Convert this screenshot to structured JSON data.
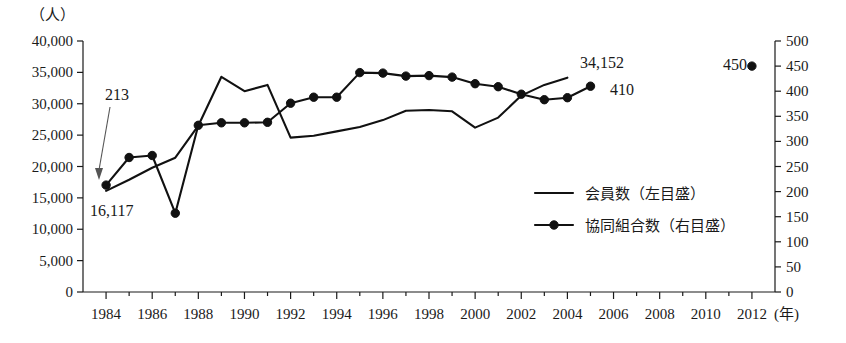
{
  "axes": {
    "left_unit": "（人）",
    "left_ticks": [
      "40,000",
      "35,000",
      "30,000",
      "25,000",
      "20,000",
      "15,000",
      "10,000",
      "5,000",
      "0"
    ],
    "left_min": 0,
    "left_max": 40000,
    "left_step": 5000,
    "right_ticks": [
      "500",
      "450",
      "400",
      "350",
      "300",
      "250",
      "200",
      "150",
      "100",
      "50",
      "0"
    ],
    "right_min": 0,
    "right_max": 500,
    "right_step": 50,
    "x_unit": "(年)",
    "x_ticks": [
      "1984",
      "1986",
      "1988",
      "1990",
      "1992",
      "1994",
      "1996",
      "1998",
      "2000",
      "2002",
      "2004",
      "2006",
      "2008",
      "2010",
      "2012"
    ],
    "x_min": 1983,
    "x_max": 2013
  },
  "legend": {
    "items": [
      {
        "label": "会員数（左目盛）",
        "marker": "line"
      },
      {
        "label": "協同組合数（右目盛）",
        "marker": "line-dot"
      }
    ]
  },
  "annotations": [
    {
      "name": "coop-start-value",
      "text": "213",
      "x": 105,
      "y": 100
    },
    {
      "name": "member-start-value",
      "text": "16,117",
      "x": 90,
      "y": 216
    },
    {
      "name": "member-end-value",
      "text": "34,152",
      "x": 580,
      "y": 68
    },
    {
      "name": "coop-end-value",
      "text": "410",
      "x": 610,
      "y": 95
    },
    {
      "name": "coop-2012-value",
      "text": "450",
      "x": 723,
      "y": 70
    }
  ],
  "chart_data": {
    "type": "line",
    "title": "",
    "xlabel": "(年)",
    "ylabel": "（人）",
    "ylabel_right": "",
    "grid": false,
    "legend_position": "inside-right",
    "xlim": [
      1983,
      2013
    ],
    "ylim": [
      0,
      40000
    ],
    "ylim_right": [
      0,
      500
    ],
    "x": [
      1984,
      1985,
      1986,
      1987,
      1988,
      1989,
      1990,
      1991,
      1992,
      1993,
      1994,
      1995,
      1996,
      1997,
      1998,
      1999,
      2000,
      2001,
      2002,
      2003,
      2004
    ],
    "series": [
      {
        "name": "会員数（左目盛）",
        "axis": "left",
        "marker": "none",
        "values": [
          16117,
          17900,
          19800,
          21400,
          26500,
          34300,
          32000,
          33000,
          24600,
          24900,
          25600,
          26300,
          27400,
          28900,
          29000,
          28800,
          26200,
          27800,
          31300,
          33000,
          34152
        ]
      },
      {
        "name": "協同組合数（右目盛）",
        "axis": "right",
        "marker": "circle",
        "x": [
          1984,
          1985,
          1986,
          1987,
          1988,
          1989,
          1990,
          1991,
          1992,
          1993,
          1994,
          1995,
          1996,
          1997,
          1998,
          1999,
          2000,
          2001,
          2002,
          2003,
          2004,
          2005
        ],
        "values": [
          213,
          268,
          272,
          157,
          332,
          337,
          337,
          338,
          376,
          388,
          388,
          437,
          436,
          430,
          431,
          428,
          415,
          409,
          394,
          383,
          387,
          410
        ]
      },
      {
        "name": "協同組合数（右目盛）-2012",
        "axis": "right",
        "marker": "circle",
        "x": [
          2012
        ],
        "values": [
          450
        ],
        "isolated": true
      }
    ]
  }
}
